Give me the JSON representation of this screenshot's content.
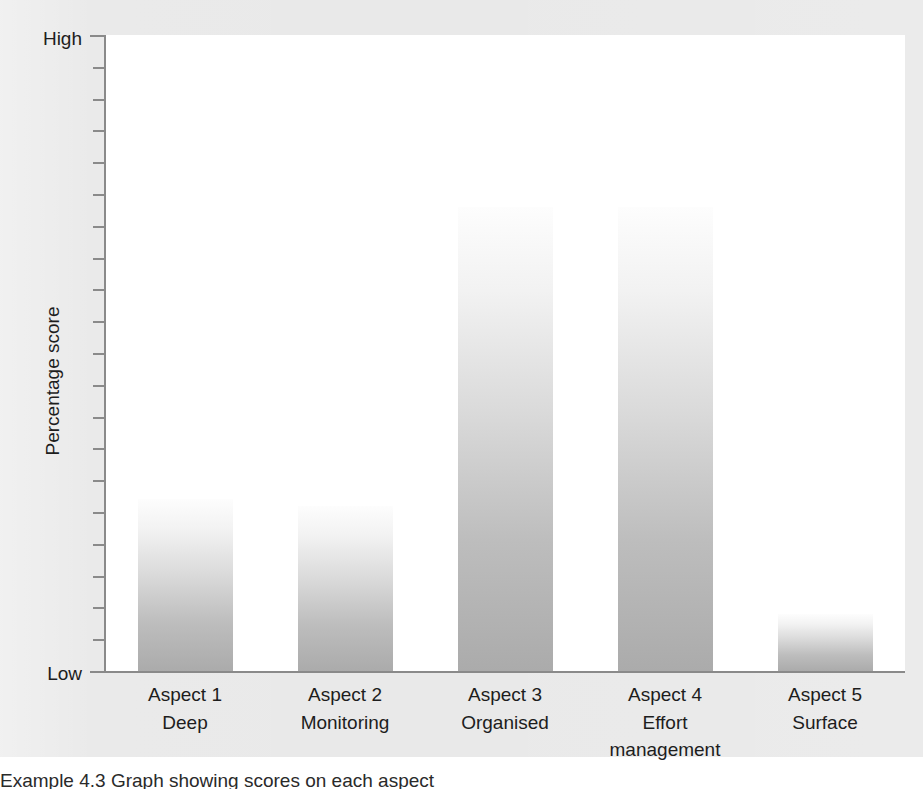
{
  "chart_data": {
    "type": "bar",
    "title": "",
    "xlabel": "",
    "ylabel": "Percentage score",
    "ylim": [
      "Low",
      "High"
    ],
    "grid": false,
    "legend": "none",
    "axis_endpoints": {
      "high": "High",
      "low": "Low"
    },
    "tick_count": 21,
    "categories": [
      "Aspect 1",
      "Aspect 2",
      "Aspect 3",
      "Aspect 4",
      "Aspect 5"
    ],
    "category_sublabels": [
      "Deep",
      "Monitoring",
      "Organised",
      "Effort management",
      "Surface"
    ],
    "values": [
      27,
      26,
      73,
      73,
      9
    ],
    "value_unit": "relative percentage score (Low–High scale, unlabelled)",
    "bar_style": "vertical gradient, white at top to grey at base",
    "colors": {
      "background": "#e9e9e9",
      "plot_background": "#ffffff",
      "axis": "#8a8a8a",
      "bar_top": "#fdfdfd",
      "bar_bottom": "#ababab",
      "text": "#1d1d1d"
    }
  },
  "caption": {
    "text": "Example 4.3  Graph showing scores on each aspect"
  }
}
